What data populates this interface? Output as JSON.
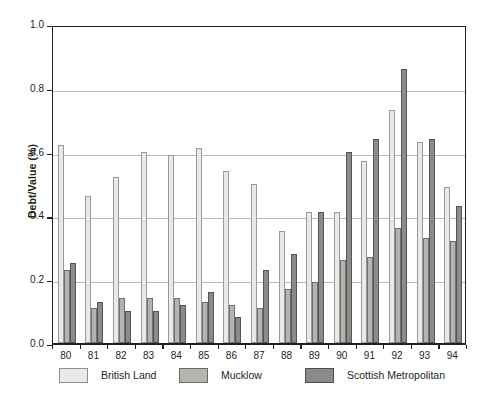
{
  "chart_data": {
    "type": "bar",
    "title": "",
    "xlabel": "",
    "ylabel": "Debt/Value (%)",
    "ylim": [
      0.0,
      1.0
    ],
    "yticks": [
      "0.0",
      "0.2",
      "0.4",
      "0.6",
      "0.8",
      "1.0"
    ],
    "ytick_values": [
      0.0,
      0.2,
      0.4,
      0.6,
      0.8,
      1.0
    ],
    "grid": "horizontal",
    "legend_position": "below",
    "categories": [
      "80",
      "81",
      "82",
      "83",
      "84",
      "85",
      "86",
      "87",
      "88",
      "89",
      "90",
      "91",
      "92",
      "93",
      "94"
    ],
    "series": [
      {
        "name": "British Land",
        "color": "#e9e9e7",
        "values": [
          0.62,
          0.46,
          0.52,
          0.6,
          0.59,
          0.61,
          0.54,
          0.5,
          0.35,
          0.41,
          0.41,
          0.57,
          0.73,
          0.63,
          0.49
        ]
      },
      {
        "name": "Mucklow",
        "color": "#b4b4b1",
        "values": [
          0.23,
          0.11,
          0.14,
          0.14,
          0.14,
          0.13,
          0.12,
          0.11,
          0.17,
          0.19,
          0.26,
          0.27,
          0.36,
          0.33,
          0.32
        ]
      },
      {
        "name": "Scottish Metropolitan",
        "color": "#8b8b89",
        "values": [
          0.25,
          0.13,
          0.1,
          0.1,
          0.12,
          0.16,
          0.08,
          0.23,
          0.28,
          0.41,
          0.6,
          0.64,
          0.86,
          0.64,
          0.43
        ]
      }
    ]
  },
  "legend": {
    "items": [
      {
        "label": "British Land"
      },
      {
        "label": "Mucklow"
      },
      {
        "label": "Scottish Metropolitan"
      }
    ]
  }
}
